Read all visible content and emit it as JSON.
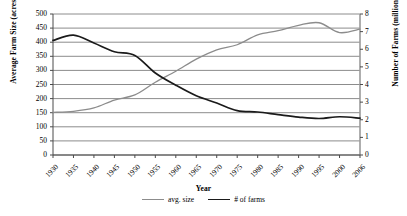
{
  "chart_data": {
    "type": "line",
    "title": "",
    "xlabel": "Year",
    "ylabel": "Average Farm Size (acres)",
    "y2label": "Number of Farms (millions)",
    "grid": true,
    "legend_position": "bottom",
    "x": [
      1930,
      1935,
      1940,
      1945,
      1950,
      1955,
      1960,
      1965,
      1970,
      1975,
      1980,
      1985,
      1990,
      1995,
      2000,
      2006
    ],
    "xticklabels": [
      "1930",
      "1935",
      "1940",
      "1945",
      "1950",
      "1955",
      "1960",
      "1965",
      "1970",
      "1975",
      "1980",
      "1985",
      "1990",
      "1995",
      "2000",
      "2006"
    ],
    "ylim": [
      0,
      500
    ],
    "yticks": [
      0,
      50,
      100,
      150,
      200,
      250,
      300,
      350,
      400,
      450,
      500
    ],
    "yticklabels": [
      "0",
      "50",
      "100",
      "150",
      "200",
      "250",
      "300",
      "350",
      "400",
      "450",
      "500"
    ],
    "y2lim": [
      0,
      8
    ],
    "y2ticks": [
      0,
      1,
      2,
      3,
      4,
      5,
      6,
      7,
      8
    ],
    "y2ticklabels": [
      "0",
      "1",
      "2",
      "3",
      "4",
      "5",
      "6",
      "7",
      "8"
    ],
    "series": [
      {
        "name": "avg. size",
        "axis": "left",
        "color": "#8c8c8c",
        "values": [
          151,
          155,
          167,
          195,
          213,
          258,
          297,
          340,
          373,
          391,
          426,
          441,
          460,
          469,
          434,
          446
        ]
      },
      {
        "name": "# of farms",
        "axis": "right",
        "color": "#1a1a1a",
        "values": [
          6.5,
          6.8,
          6.35,
          5.86,
          5.65,
          4.65,
          3.96,
          3.36,
          2.95,
          2.52,
          2.44,
          2.29,
          2.15,
          2.07,
          2.17,
          2.09
        ]
      }
    ]
  }
}
